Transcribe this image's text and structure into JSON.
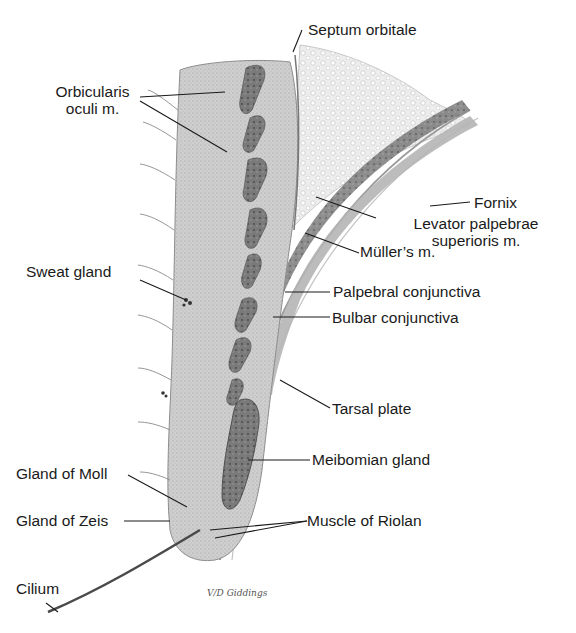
{
  "figure": {
    "signature": "Giddings",
    "signature_prefix": "V/D"
  },
  "labels": {
    "septum_orbitale": "Septum orbitale",
    "orbicularis_line1": "Orbicularis",
    "orbicularis_line2": "oculi m.",
    "fornix": "Fornix",
    "levator_line1": "Levator palpebrae",
    "levator_line2": "superioris m.",
    "sweat_gland": "Sweat gland",
    "muller": "Müller’s m.",
    "palpebral_conjunctiva": "Palpebral conjunctiva",
    "bulbar_conjunctiva": "Bulbar conjunctiva",
    "tarsal_plate": "Tarsal plate",
    "meibomian_gland": "Meibomian gland",
    "gland_of_moll": "Gland of Moll",
    "gland_of_zeis": "Gland of Zeis",
    "muscle_of_riolan": "Muscle of Riolan",
    "cilium": "Cilium"
  },
  "colors": {
    "background": "#ffffff",
    "skin_tissue": "#c9c9c9",
    "muscle_dark": "#6e6e6e",
    "fat": "#e6e6e6",
    "levator_band": "#7a7a7a",
    "leader_line": "#1a1a1a"
  }
}
